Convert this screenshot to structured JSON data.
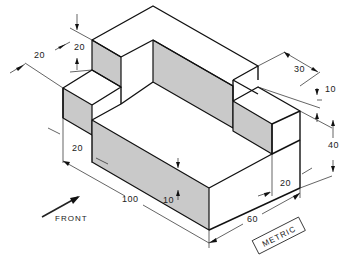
{
  "figure": {
    "type": "isometric technical drawing",
    "units_label": "METRIC",
    "view_direction_label": "FRONT"
  },
  "dimensions": {
    "step_height_left": "20",
    "step_depth_left": "20",
    "front_step_width": "20",
    "overall_length": "100",
    "base_thickness": "10",
    "overall_width": "60",
    "right_step_width": "20",
    "overall_height": "40",
    "rear_block_depth": "30",
    "right_step_height": "10"
  },
  "colors": {
    "line": "#111111",
    "shaded_face": "#c9c9c9",
    "background": "#ffffff"
  }
}
